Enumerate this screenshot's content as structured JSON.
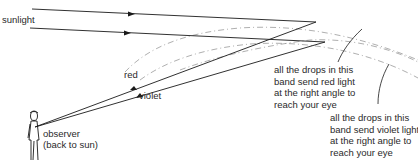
{
  "diagram": {
    "labels": {
      "sunlight": "sunlight",
      "red": "red",
      "violet": "violet",
      "observer_line1": "observer",
      "observer_line2": "(back to sun)"
    },
    "annotations": {
      "red_band": [
        "all the drops in this",
        "band send red light",
        "at the right angle to",
        "reach your eye"
      ],
      "violet_band": [
        "all the drops in this",
        "band send violet light",
        "at the right angle to",
        "reach your eye"
      ]
    },
    "colors": {
      "line": "#1a1a1a",
      "arc": "#9a9a9a",
      "text": "#2a2a2a",
      "background": "#ffffff"
    }
  }
}
